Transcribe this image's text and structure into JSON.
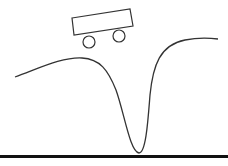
{
  "game": {
    "name": "Mountain Car",
    "colors": {
      "background": "#ffffff",
      "track": "#333333",
      "car": "#333333",
      "ground": "#111111"
    },
    "track_path": "M15,77 C40,68 62,57 82,58 C100,59 108,70 116,90 C124,112 130,152 139,153 C146,153 148,120 150,95 C153,65 160,45 185,40 C200,37 210,38 218,39",
    "car": {
      "body_points": "72,18 130,9 133,26 74,35",
      "wheels": [
        {
          "cx": 89,
          "cy": 42,
          "r": 6
        },
        {
          "cx": 119,
          "cy": 36,
          "r": 6
        }
      ]
    },
    "ground": {
      "y": 156,
      "thickness": 3
    }
  }
}
